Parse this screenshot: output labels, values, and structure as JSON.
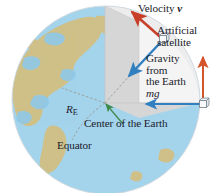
{
  "figure": {
    "type": "physics-diagram"
  },
  "labels": {
    "velocity": "Velocity",
    "velocity_symbol": "v",
    "satellite_line1": "Artificial",
    "satellite_line2": "satellite",
    "gravity_line1": "Gravity",
    "gravity_line2": "from",
    "gravity_line3": "the Earth",
    "gravity_symbol": "mg",
    "center": "Center of the Earth",
    "equator": "Equator",
    "radius_symbol": "R",
    "radius_subscript": "E"
  },
  "colors": {
    "velocity_arrow": "#c8402a",
    "gravity_arrow": "#2f7fc1",
    "weight_arrow": "#d4542c",
    "normal_arrow": "#2f7fc1",
    "center_arrow": "#3f8a4a",
    "ocean": "#a4d3ec",
    "land": "#cfc089",
    "wedge_light": "#f2f2f2",
    "wedge_mid": "#e3e3e3",
    "wedge_dark": "#d2d2d2",
    "text": "#1b1b2b",
    "dashed_line": "#9a9a8c"
  },
  "geometry": {
    "globe_center_x": 106,
    "globe_center_y": 100,
    "globe_radius": 94,
    "earth_center_x": 105,
    "earth_center_y": 103,
    "satellite_x": 163,
    "satellite_y": 39,
    "weight_box_x": 203,
    "weight_box_y": 104
  }
}
